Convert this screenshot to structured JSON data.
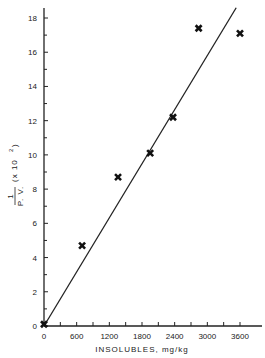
{
  "chart_data": {
    "type": "scatter",
    "title": "",
    "xlabel": "INSOLUBLES, mg/kg",
    "ylabel": "1 / P.V. (x 10^2)",
    "ylabel_parts": {
      "numerator": "1",
      "denominator": "P. V.",
      "multiplier": "(x 10",
      "exponent": "2",
      "close": ")"
    },
    "xlim": [
      0,
      3800
    ],
    "ylim": [
      0,
      18.6
    ],
    "x_ticks": [
      0,
      600,
      1200,
      1800,
      2400,
      3000,
      3600
    ],
    "x_tick_labels": [
      "0",
      "600",
      "1200",
      "1800",
      "2400",
      "3000",
      "3600"
    ],
    "x_minor_ticks": [
      300,
      900,
      1500,
      2100,
      2700,
      3300
    ],
    "y_ticks": [
      0,
      2,
      4,
      6,
      8,
      10,
      12,
      14,
      16,
      18
    ],
    "y_tick_labels": [
      "0",
      "2",
      "4",
      "6",
      "8",
      "10",
      "12",
      "14",
      "16",
      "18"
    ],
    "y_minor_ticks": [
      1,
      3,
      5,
      7,
      9,
      11,
      13,
      15,
      17
    ],
    "grid": false,
    "legend": null,
    "series": [
      {
        "name": "data",
        "marker": "x-filled",
        "x": [
          0,
          700,
          1360,
          1950,
          2370,
          2840,
          3600
        ],
        "y": [
          0.1,
          4.7,
          8.7,
          10.1,
          12.2,
          17.4,
          17.1
        ]
      }
    ],
    "fit_line": {
      "x": [
        0,
        3530
      ],
      "y": [
        0,
        18.6
      ]
    }
  }
}
